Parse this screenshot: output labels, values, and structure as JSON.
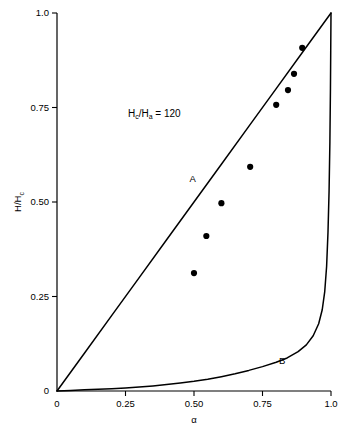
{
  "chart_data": {
    "type": "line",
    "title": "",
    "subtitle": "",
    "xlabel": "α",
    "ylabel": "H/H",
    "ylabel_sub": "c",
    "xlim": [
      0,
      1.0
    ],
    "ylim": [
      0,
      1.0
    ],
    "grid": false,
    "legend": "none",
    "x_ticks": [
      {
        "value": 0,
        "label": "0"
      },
      {
        "value": 0.25,
        "label": "0.25"
      },
      {
        "value": 0.5,
        "label": "0.50"
      },
      {
        "value": 0.75,
        "label": "0.75"
      },
      {
        "value": 1.0,
        "label": "1.0"
      }
    ],
    "y_ticks": [
      {
        "value": 0,
        "label": "0"
      },
      {
        "value": 0.25,
        "label": "0.25"
      },
      {
        "value": 0.5,
        "label": "0.50"
      },
      {
        "value": 0.75,
        "label": "0.75"
      },
      {
        "value": 1.0,
        "label": "1.0"
      }
    ],
    "annotations": [
      {
        "name": "parameter-annotation",
        "text_parts": [
          "H",
          "c",
          "/H",
          "a",
          " = 120"
        ],
        "text": "Hc/Ha = 120",
        "x": 0.355,
        "y": 0.725
      },
      {
        "name": "curve-a-label",
        "text": "A",
        "x": 0.495,
        "y": 0.553
      },
      {
        "name": "curve-b-label",
        "text": "B",
        "x": 0.822,
        "y": 0.072
      }
    ],
    "series": [
      {
        "name": "A",
        "kind": "line",
        "label": "A",
        "color": "#000000",
        "points": [
          [
            0.0,
            0.0
          ],
          [
            0.1,
            0.1
          ],
          [
            0.2,
            0.2
          ],
          [
            0.3,
            0.3
          ],
          [
            0.4,
            0.4
          ],
          [
            0.5,
            0.5
          ],
          [
            0.6,
            0.6
          ],
          [
            0.7,
            0.7
          ],
          [
            0.8,
            0.8
          ],
          [
            0.9,
            0.9
          ],
          [
            1.0,
            1.0
          ]
        ]
      },
      {
        "name": "B",
        "kind": "line",
        "label": "B",
        "color": "#000000",
        "points": [
          [
            0.0,
            0.0
          ],
          [
            0.05,
            0.0015
          ],
          [
            0.1,
            0.003
          ],
          [
            0.15,
            0.0045
          ],
          [
            0.2,
            0.006
          ],
          [
            0.25,
            0.008
          ],
          [
            0.3,
            0.0105
          ],
          [
            0.35,
            0.0135
          ],
          [
            0.4,
            0.017
          ],
          [
            0.45,
            0.021
          ],
          [
            0.5,
            0.0255
          ],
          [
            0.55,
            0.031
          ],
          [
            0.6,
            0.038
          ],
          [
            0.65,
            0.0455
          ],
          [
            0.7,
            0.0545
          ],
          [
            0.75,
            0.0645
          ],
          [
            0.8,
            0.076
          ],
          [
            0.84,
            0.0875
          ],
          [
            0.88,
            0.104
          ],
          [
            0.91,
            0.122
          ],
          [
            0.935,
            0.146
          ],
          [
            0.955,
            0.178
          ],
          [
            0.968,
            0.215
          ],
          [
            0.977,
            0.262
          ],
          [
            0.984,
            0.33
          ],
          [
            0.989,
            0.42
          ],
          [
            0.993,
            0.53
          ],
          [
            0.996,
            0.66
          ],
          [
            0.998,
            0.8
          ],
          [
            0.999,
            0.9
          ],
          [
            1.0,
            1.0
          ]
        ]
      },
      {
        "name": "measured-data",
        "kind": "scatter",
        "label": "",
        "color": "#000000",
        "marker": "filled-circle",
        "points": [
          [
            0.5,
            0.312
          ],
          [
            0.545,
            0.41
          ],
          [
            0.6,
            0.497
          ],
          [
            0.705,
            0.593
          ],
          [
            0.8,
            0.757
          ],
          [
            0.843,
            0.796
          ],
          [
            0.865,
            0.839
          ],
          [
            0.895,
            0.908
          ]
        ]
      }
    ]
  },
  "figure": {
    "plot_left": 57,
    "plot_right": 331,
    "plot_top": 13,
    "plot_bottom": 391
  }
}
